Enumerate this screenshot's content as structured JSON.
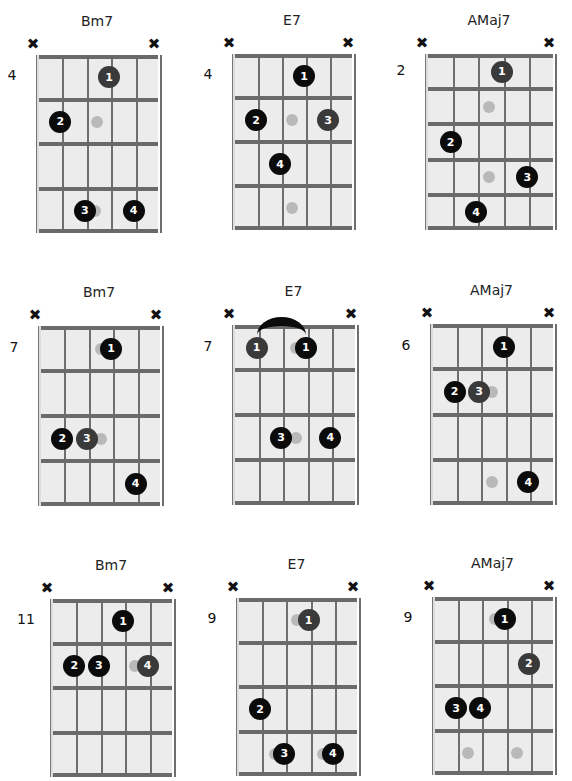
{
  "colors": {
    "dot": "#0b0b0b",
    "dot_dim": "#3a3a3a",
    "ghost": "#b9b9b9",
    "board": "#ececec",
    "lines": "#6a6a6a"
  },
  "chords": [
    {
      "name": "Bm7",
      "start_fret": "4",
      "frets": 4,
      "box": {
        "x": 36,
        "y": 55,
        "w": 122,
        "h": 178
      },
      "mutes": [
        "x",
        "x"
      ],
      "dots": [
        {
          "s": 4,
          "f": 1,
          "label": "1",
          "dim": true
        },
        {
          "s": 2,
          "f": 2,
          "label": "2"
        },
        {
          "s": 3,
          "f": 4,
          "label": "3"
        },
        {
          "s": 5,
          "f": 4,
          "label": "4"
        }
      ],
      "ghosts": [
        {
          "s": 3.5,
          "f": 2
        },
        {
          "s": 3.4,
          "f": 4
        }
      ]
    },
    {
      "name": "E7",
      "start_fret": "4",
      "frets": 4,
      "box": {
        "x": 232,
        "y": 54,
        "w": 120,
        "h": 176
      },
      "mutes": [
        "x",
        "x"
      ],
      "dots": [
        {
          "s": 4,
          "f": 1,
          "label": "1"
        },
        {
          "s": 2,
          "f": 2,
          "label": "2"
        },
        {
          "s": 5,
          "f": 2,
          "label": "3",
          "dim": true
        },
        {
          "s": 3,
          "f": 3,
          "label": "4"
        }
      ],
      "ghosts": [
        {
          "s": 3.5,
          "f": 2
        },
        {
          "s": 3.5,
          "f": 4
        }
      ]
    },
    {
      "name": "AMaj7",
      "start_fret": "2",
      "frets": 5,
      "box": {
        "x": 425,
        "y": 54,
        "w": 128,
        "h": 176
      },
      "mutes": [
        "x",
        "x"
      ],
      "dots": [
        {
          "s": 4,
          "f": 1,
          "label": "1",
          "dim": true
        },
        {
          "s": 2,
          "f": 3,
          "label": "2"
        },
        {
          "s": 5,
          "f": 4,
          "label": "3"
        },
        {
          "s": 3,
          "f": 5,
          "label": "4"
        }
      ],
      "ghosts": [
        {
          "s": 3.5,
          "f": 2
        },
        {
          "s": 3.5,
          "f": 4
        }
      ]
    },
    {
      "name": "Bm7",
      "start_fret": "7",
      "frets": 4,
      "box": {
        "x": 38,
        "y": 326,
        "w": 122,
        "h": 180
      },
      "mutes": [
        "x",
        "x"
      ],
      "dots": [
        {
          "s": 4,
          "f": 1,
          "label": "1"
        },
        {
          "s": 2,
          "f": 3,
          "label": "2"
        },
        {
          "s": 3,
          "f": 3,
          "label": "3",
          "dim": true
        },
        {
          "s": 5,
          "f": 4,
          "label": "4"
        }
      ],
      "ghosts": [
        {
          "s": 3.6,
          "f": 1
        },
        {
          "s": 3.6,
          "f": 3
        }
      ]
    },
    {
      "name": "E7",
      "start_fret": "7",
      "frets": 4,
      "box": {
        "x": 232,
        "y": 325,
        "w": 123,
        "h": 180
      },
      "mutes": [
        "x",
        "x"
      ],
      "dots": [
        {
          "s": 2,
          "f": 1,
          "label": "1",
          "dim": true
        },
        {
          "s": 4,
          "f": 1,
          "label": "1"
        },
        {
          "s": 3,
          "f": 3,
          "label": "3"
        },
        {
          "s": 5,
          "f": 3,
          "label": "4"
        }
      ],
      "ghosts": [
        {
          "s": 3.6,
          "f": 1
        },
        {
          "s": 3.6,
          "f": 3
        }
      ],
      "barre": {
        "from": 2,
        "to": 4
      }
    },
    {
      "name": "AMaj7",
      "start_fret": "6",
      "frets": 4,
      "box": {
        "x": 430,
        "y": 324,
        "w": 123,
        "h": 181
      },
      "mutes": [
        "x",
        "x"
      ],
      "dots": [
        {
          "s": 4,
          "f": 1,
          "label": "1"
        },
        {
          "s": 2,
          "f": 2,
          "label": "2"
        },
        {
          "s": 3,
          "f": 2,
          "label": "3",
          "dim": true
        },
        {
          "s": 5,
          "f": 4,
          "label": "4"
        }
      ],
      "ghosts": [
        {
          "s": 3.5,
          "f": 2
        },
        {
          "s": 3.5,
          "f": 4
        }
      ]
    },
    {
      "name": "Bm7",
      "start_fret": "11",
      "frets": 4,
      "box": {
        "x": 50,
        "y": 599,
        "w": 122,
        "h": 178
      },
      "mutes": [
        "x",
        "x"
      ],
      "dots": [
        {
          "s": 4,
          "f": 1,
          "label": "1"
        },
        {
          "s": 2,
          "f": 2,
          "label": "2"
        },
        {
          "s": 3,
          "f": 2,
          "label": "3"
        },
        {
          "s": 5,
          "f": 2,
          "label": "4",
          "dim": true
        }
      ],
      "ghosts": [
        {
          "s": 4.5,
          "f": 2
        }
      ]
    },
    {
      "name": "E7",
      "start_fret": "9",
      "frets": 4,
      "box": {
        "x": 236,
        "y": 598,
        "w": 121,
        "h": 178
      },
      "mutes": [
        "x",
        "x"
      ],
      "dots": [
        {
          "s": 4,
          "f": 1,
          "label": "1",
          "dim": true
        },
        {
          "s": 2,
          "f": 3,
          "label": "2"
        },
        {
          "s": 3,
          "f": 4,
          "label": "3"
        },
        {
          "s": 5,
          "f": 4,
          "label": "4"
        }
      ],
      "ghosts": [
        {
          "s": 3.5,
          "f": 1
        },
        {
          "s": 2.6,
          "f": 4
        },
        {
          "s": 4.6,
          "f": 4
        }
      ]
    },
    {
      "name": "AMaj7",
      "start_fret": "9",
      "frets": 4,
      "box": {
        "x": 432,
        "y": 597,
        "w": 121,
        "h": 178
      },
      "mutes": [
        "x",
        "x"
      ],
      "dots": [
        {
          "s": 4,
          "f": 1,
          "label": "1"
        },
        {
          "s": 5,
          "f": 2,
          "label": "2",
          "dim": true
        },
        {
          "s": 2,
          "f": 3,
          "label": "3"
        },
        {
          "s": 3,
          "f": 3,
          "label": "4"
        }
      ],
      "ghosts": [
        {
          "s": 3.6,
          "f": 1
        },
        {
          "s": 2.5,
          "f": 4
        },
        {
          "s": 4.5,
          "f": 4
        }
      ]
    }
  ]
}
